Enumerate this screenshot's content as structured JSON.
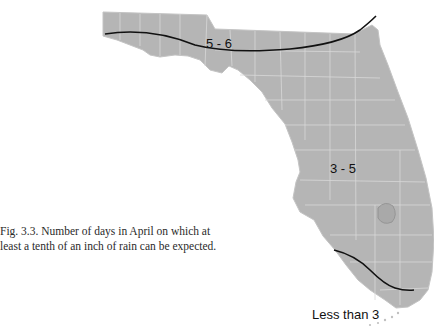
{
  "figure": {
    "caption_line1": "Fig. 3.3. Number of days in April on which at",
    "caption_line2": "least a tenth of an inch of rain can be expected.",
    "state": "Florida",
    "fill_color": "#b5b5b5",
    "border_color": "#d8d8d8",
    "isoline_color": "#111111"
  },
  "zones": [
    {
      "label": "5 - 6",
      "x": 222,
      "y": 44
    },
    {
      "label": "3 - 5",
      "x": 333,
      "y": 172
    },
    {
      "label": "Less than 3",
      "x": 325,
      "y": 317
    }
  ]
}
